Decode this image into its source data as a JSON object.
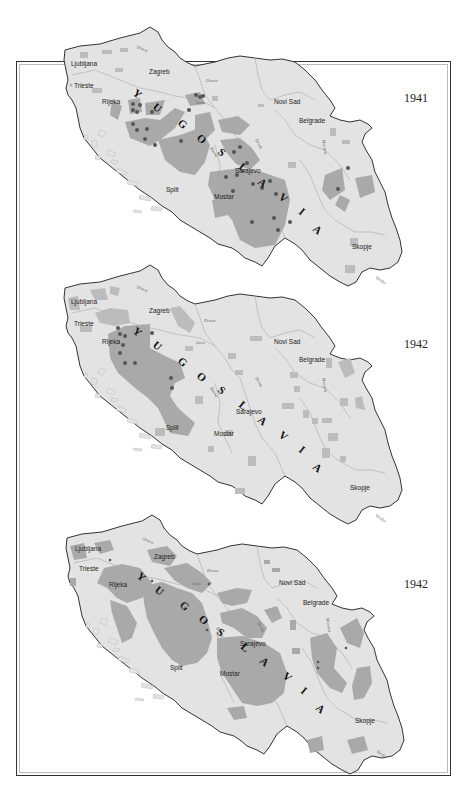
{
  "maps": [
    {
      "year": "1941",
      "country": "YUGOSLAVIA"
    },
    {
      "year": "1942",
      "country": "YUGOSLAVIA"
    },
    {
      "year": "1942",
      "country": "YUGOSLAVIA"
    }
  ],
  "cities": {
    "ljubljana": "Ljubljana",
    "trieste": "Trieste",
    "zagreb": "Zagreb",
    "rijeka": "Rijeka",
    "novi_sad": "Novi Sad",
    "belgrade": "Belgrade",
    "sarajevo": "Sarajevo",
    "split": "Split",
    "mostar": "Mostar",
    "skopje": "Skopje"
  },
  "rivers": {
    "drava": "Drava",
    "sava": "Sava",
    "drina": "Drina",
    "bosna": "Bosna",
    "morava": "Morava",
    "vardar": "Vardar"
  },
  "letters": [
    "Y",
    "U",
    "G",
    "O",
    "S",
    "L",
    "A",
    "V",
    "I",
    "A"
  ],
  "colors": {
    "land": "#e3e3e3",
    "controlled_zone": "#a9a9a9",
    "frame": "#333333",
    "dot": "#555555"
  }
}
